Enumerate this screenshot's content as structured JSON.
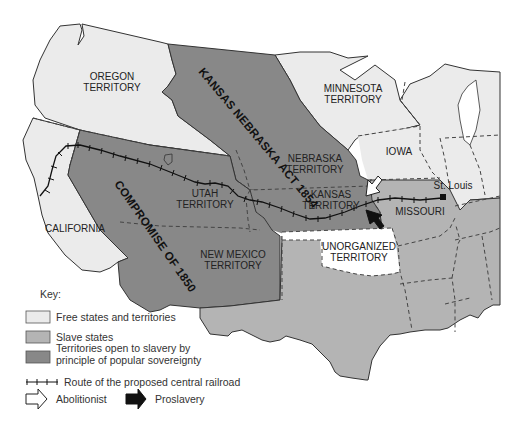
{
  "map": {
    "colors": {
      "free": "#ebebeb",
      "slave": "#b4b4b4",
      "popular_sovereignty": "#888888",
      "unorganized": "#ffffff",
      "water": "#ffffff",
      "border": "#444444"
    },
    "regions": {
      "oregon": "OREGON",
      "oregon2": "TERRITORY",
      "minnesota": "MINNESOTA",
      "minnesota2": "TERRITORY",
      "iowa": "IOWA",
      "nebraska": "NEBRASKA",
      "nebraska2": "TERRITORY",
      "kansas": "KANSAS",
      "kansas2": "TERRITORY",
      "missouri": "MISSOURI",
      "utah": "UTAH",
      "utah2": "TERRITORY",
      "california": "CALIFORNIA",
      "new_mexico": "NEW MEXICO",
      "new_mexico2": "TERRITORY",
      "unorganized": "UNORGANIZED",
      "unorganized2": "TERRITORY"
    },
    "cities": {
      "st_louis": "St. Louis"
    },
    "annotations": {
      "kansas_nebraska_act": "KANSAS NEBRASKA ACT 1854",
      "compromise": "COMPROMISE OF 1850"
    }
  },
  "legend": {
    "title": "Key:",
    "items": [
      {
        "label": "Free states and territories",
        "color": "#ebebeb"
      },
      {
        "label": "Slave states",
        "color": "#b4b4b4"
      },
      {
        "label": "Territories open to slavery by",
        "label2": "principle of popular sovereignty",
        "color": "#888888"
      }
    ],
    "railroad": "Route of the proposed central railroad",
    "abolitionist": "Abolitionist",
    "proslavery": "Proslavery"
  }
}
